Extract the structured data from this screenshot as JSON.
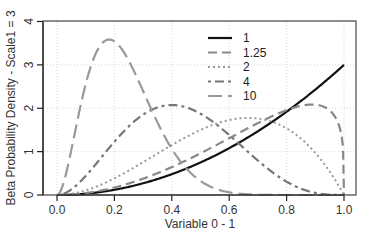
{
  "chart_data": {
    "type": "line",
    "title": "",
    "xlabel": "Variable 0 - 1",
    "ylabel": "Beta Probability Density - Scale1 = 3",
    "xlim": [
      0,
      1
    ],
    "ylim": [
      0,
      4
    ],
    "xticks": [
      "0.0",
      "0.2",
      "0.4",
      "0.6",
      "0.8",
      "1.0"
    ],
    "xtick_values": [
      0,
      0.2,
      0.4,
      0.6,
      0.8,
      1.0
    ],
    "yticks": [
      "0",
      "1",
      "2",
      "3",
      "4"
    ],
    "ytick_values": [
      0,
      1,
      2,
      3,
      4
    ],
    "grid": true,
    "legend_position": "top-center",
    "distribution": "Beta(shape1 = 3, shape2 = legend value)",
    "shape1": 3,
    "series": [
      {
        "name": "1",
        "shape2": 1,
        "color": "#111111",
        "style": "solid",
        "x": [
          0,
          0.2,
          0.4,
          0.6,
          0.8,
          1.0
        ],
        "y": [
          0,
          0.12,
          0.48,
          1.08,
          1.92,
          3.0
        ]
      },
      {
        "name": "1.25",
        "shape2": 1.25,
        "color": "#888888",
        "style": "dashed",
        "x": [
          0,
          0.2,
          0.4,
          0.6,
          0.8,
          0.9,
          1.0
        ],
        "y": [
          0,
          0.19,
          0.67,
          1.33,
          1.95,
          2.09,
          0
        ]
      },
      {
        "name": "2",
        "shape2": 2,
        "color": "#999999",
        "style": "dotted",
        "x": [
          0,
          0.2,
          0.4,
          0.6,
          0.667,
          0.8,
          1.0
        ],
        "y": [
          0,
          0.38,
          1.15,
          1.73,
          1.78,
          1.54,
          0
        ]
      },
      {
        "name": "4",
        "shape2": 4,
        "color": "#777777",
        "style": "dotdash",
        "x": [
          0,
          0.2,
          0.4,
          0.6,
          0.8,
          1.0
        ],
        "y": [
          0,
          1.23,
          2.07,
          1.38,
          0.31,
          0
        ]
      },
      {
        "name": "10",
        "shape2": 10,
        "color": "#999999",
        "style": "longdash",
        "x": [
          0,
          0.1,
          0.18,
          0.3,
          0.4,
          0.6,
          1.0
        ],
        "y": [
          0,
          2.56,
          3.58,
          2.39,
          0.97,
          0.06,
          0
        ]
      }
    ]
  }
}
